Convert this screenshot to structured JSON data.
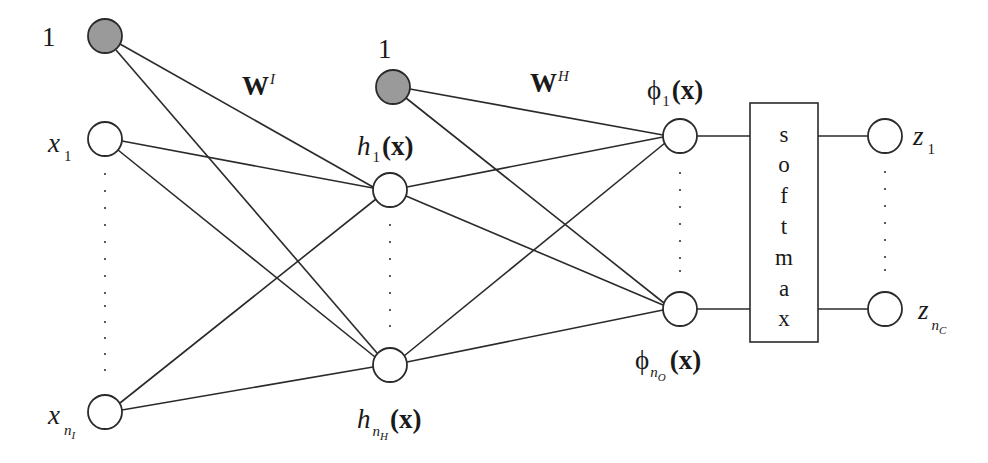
{
  "colors": {
    "bias_fill": "#9a9a9a",
    "node_fill": "#ffffff",
    "stroke": "#2a2a2a",
    "background": "#ffffff"
  },
  "layers": {
    "input": {
      "bias_label": "1",
      "first": {
        "base": "x",
        "sub": "1"
      },
      "last": {
        "base": "x",
        "sub": "n",
        "subsub": "I"
      }
    },
    "weights_input_hidden": {
      "base": "W",
      "sup": "I"
    },
    "hidden": {
      "bias_label": "1",
      "first": {
        "base": "h",
        "sub": "1",
        "arg": "(x)"
      },
      "last": {
        "base": "h",
        "sub": "n",
        "subsub": "H",
        "arg": "(x)"
      }
    },
    "weights_hidden_output": {
      "base": "W",
      "sup": "H"
    },
    "output": {
      "first": {
        "base": "ϕ",
        "sub": "1",
        "arg": "(x)"
      },
      "last": {
        "base": "ϕ",
        "sub": "n",
        "subsub": "O",
        "arg": "(x)"
      }
    },
    "softmax": {
      "letters": [
        "s",
        "o",
        "f",
        "t",
        "m",
        "a",
        "x"
      ]
    },
    "final": {
      "first": {
        "base": "z",
        "sub": "1"
      },
      "last": {
        "base": "z",
        "sub": "n",
        "subsub": "C"
      }
    }
  }
}
